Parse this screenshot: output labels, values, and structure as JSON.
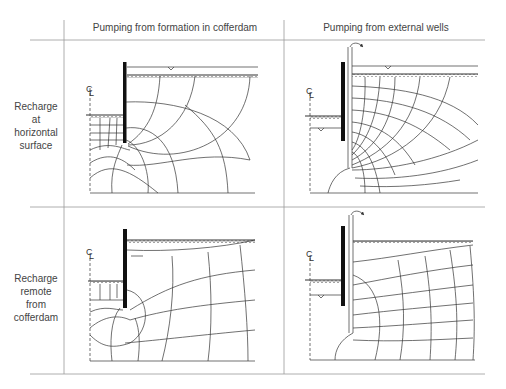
{
  "columns": [
    {
      "label": "Pumping from formation in cofferdam"
    },
    {
      "label": "Pumping from external wells"
    }
  ],
  "rows": [
    {
      "label_lines": [
        "Recharge",
        "at",
        "horizontal",
        "surface"
      ]
    },
    {
      "label_lines": [
        "Recharge",
        "remote",
        "from",
        "cofferdam"
      ]
    }
  ],
  "symbols": {
    "centerline": "CL",
    "water_table": "water-level-triangle",
    "ground_surface": "hatched-ground-line"
  },
  "panels": [
    {
      "id": "top-left",
      "row": 0,
      "col": 0,
      "description": "Flow net, sheet pile cofferdam, pumping inside, recharge at horizontal surface"
    },
    {
      "id": "top-right",
      "row": 0,
      "col": 1,
      "description": "Flow net, sheet pile cofferdam, external well pumping, recharge at horizontal surface"
    },
    {
      "id": "bottom-left",
      "row": 1,
      "col": 0,
      "description": "Flow net, pumping inside cofferdam, recharge remote"
    },
    {
      "id": "bottom-right",
      "row": 1,
      "col": 1,
      "description": "Flow net, external wells, recharge remote"
    }
  ]
}
